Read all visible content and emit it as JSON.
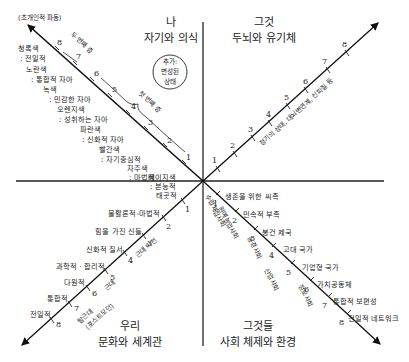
{
  "diagram": {
    "type": "four-quadrant",
    "quadrants": {
      "upper_left": {
        "line1": "나",
        "line2": "자기와 의식"
      },
      "upper_right": {
        "line1": "그것",
        "line2": "두뇌와 유기체"
      },
      "lower_left": {
        "line1": "우리",
        "line2": "문화와 세계관"
      },
      "lower_right": {
        "line1": "그것들",
        "line2": "사회 체제와 환경"
      }
    },
    "top_left_caption": "(초개인적 파동)",
    "circle_note": {
      "line1": "추가:",
      "line2": "변성된",
      "line3": "상태"
    },
    "tick_numbers": [
      "1",
      "2",
      "3",
      "4",
      "5",
      "6",
      "7",
      "8"
    ],
    "upper_left_arm": {
      "bracket_labels": {
        "first_tier": "첫 번째 층",
        "second_tier": "두 번째 층"
      },
      "levels": [
        {
          "n": "1",
          "color": "베이지색",
          "desc": ": 본능적"
        },
        {
          "n": "2",
          "color": "자주색",
          "desc": ": 마법적"
        },
        {
          "n": "3",
          "color": "빨간색",
          "desc": ": 자기중심적"
        },
        {
          "n": "4",
          "color": "파란색",
          "desc": ": 신화적 자아"
        },
        {
          "n": "5",
          "color": "오렌지색",
          "desc": ": 성취하는 자아"
        },
        {
          "n": "6",
          "color": "녹색",
          "desc": ": 민감한 자아"
        },
        {
          "n": "7",
          "color": "노란색",
          "desc": ": 통합적 자아"
        },
        {
          "n": "8",
          "color": "청록색",
          "desc": ": 전일적"
        }
      ]
    },
    "upper_right_arm": {
      "annotation": "정기의 상태, 대뇌변연계, 신피질 등"
    },
    "lower_left_arm": {
      "levels": [
        "태곳적",
        "물활론적-마법적",
        "힘을 가진 신들",
        "신화적 질서",
        "과학적 · 합리적",
        "다원적",
        "통합적",
        "전일적"
      ],
      "annotations": {
        "premodern": "근대 이전",
        "modern": "근대",
        "postmodern_line1": "탈근대",
        "postmodern_line2": "(포스트모던)"
      }
    },
    "lower_right_arm": {
      "levels": [
        "생존을 위한 씨족",
        "민속적 부족",
        "봉건 제국",
        "고대 국가",
        "기업형 국가",
        "가치공동체",
        "통합적 보편성",
        "전일적 네트워크"
      ],
      "annotations": [
        "수렵채집사회",
        "원예농업사회",
        "농경사회",
        "산업사회",
        "정보사회"
      ]
    }
  }
}
